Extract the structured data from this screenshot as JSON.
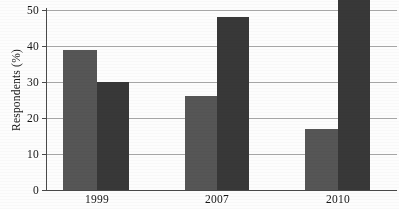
{
  "chart_data": {
    "type": "bar",
    "title": "",
    "subtitle": "",
    "xlabel": "",
    "ylabel": "Respondents (%)",
    "categories": [
      "1999",
      "2007",
      "2010"
    ],
    "series": [
      {
        "name": "series-1",
        "color": "#565656",
        "values": [
          39,
          26,
          17
        ]
      },
      {
        "name": "series-2",
        "color": "#383838",
        "values": [
          30,
          48,
          57
        ]
      }
    ],
    "ylim": [
      0,
      50
    ],
    "ytick_labels": [
      "0",
      "10",
      "20",
      "30",
      "40",
      "50"
    ],
    "ytick_values": [
      0,
      10,
      20,
      30,
      40,
      50
    ],
    "grid": true,
    "grid_axis": "y",
    "legend": false,
    "legend_position": "none",
    "annotations": []
  },
  "axes": {
    "y": {
      "label": "Respondents (%)",
      "ticks": [
        {
          "value": 50,
          "label": "50"
        },
        {
          "value": 40,
          "label": "40"
        },
        {
          "value": 30,
          "label": "30"
        },
        {
          "value": 20,
          "label": "20"
        },
        {
          "value": 10,
          "label": "10"
        },
        {
          "value": 0,
          "label": "0"
        }
      ]
    },
    "x": {
      "label": "",
      "ticks": [
        {
          "label": "1999"
        },
        {
          "label": "2007"
        },
        {
          "label": "2010"
        }
      ]
    }
  },
  "colors": {
    "series_light": "#565656",
    "series_dark": "#383838",
    "gridline": "#9a9a9a",
    "axis": "#4a4a4a",
    "background": "#fdfdfd",
    "text": "#161616"
  }
}
